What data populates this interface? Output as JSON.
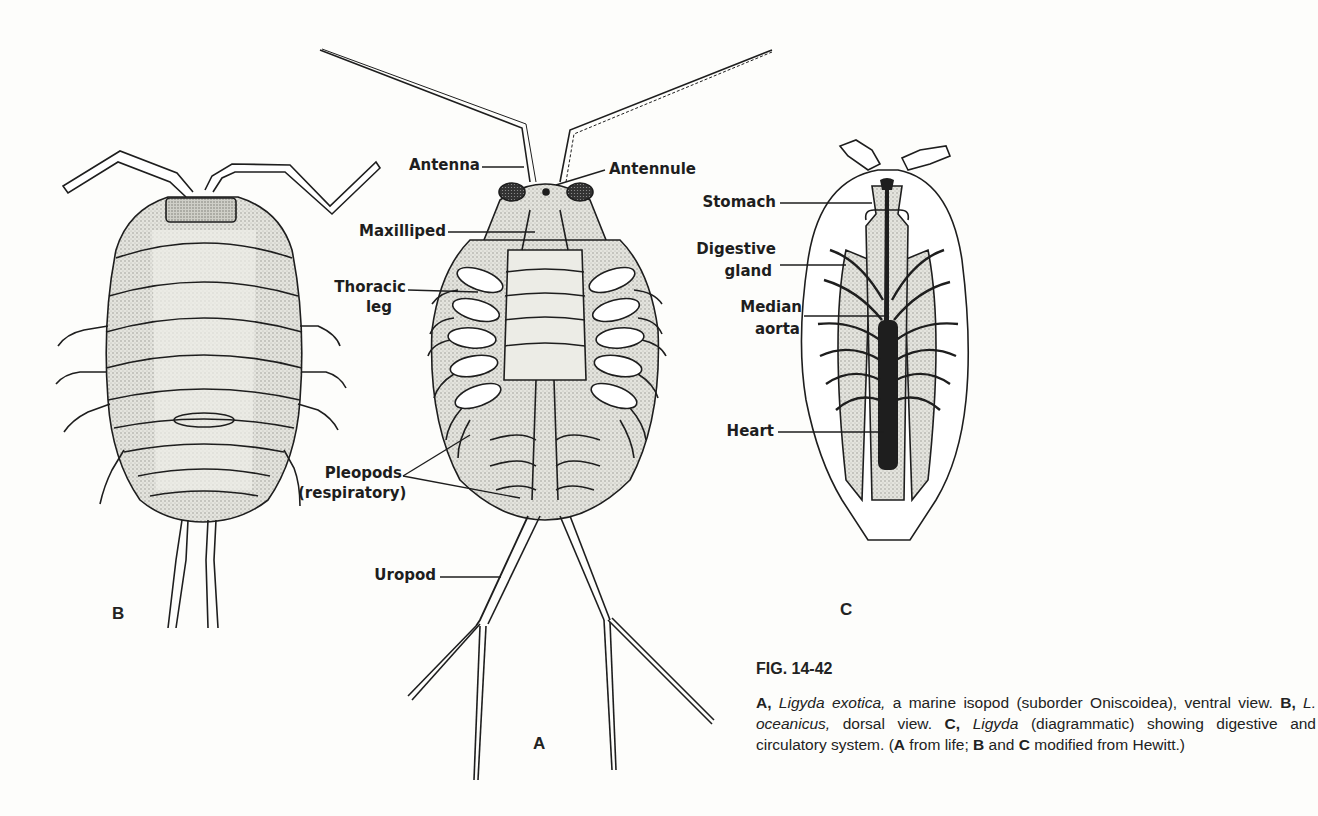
{
  "figure": {
    "number": "FIG. 14-42",
    "panels": {
      "A": {
        "letter": "A",
        "view": "ventral view"
      },
      "B": {
        "letter": "B",
        "view": "dorsal view"
      },
      "C": {
        "letter": "C",
        "view": "diagrammatic"
      }
    },
    "labels_A": {
      "antenna": "Antenna",
      "antennule": "Antennule",
      "maxilliped": "Maxilliped",
      "thoracic_leg_1": "Thoracic",
      "thoracic_leg_2": "leg",
      "pleopods_1": "Pleopods",
      "pleopods_2": "(respiratory)",
      "uropod": "Uropod"
    },
    "labels_C": {
      "stomach": "Stomach",
      "digestive_gland_1": "Digestive",
      "digestive_gland_2": "gland",
      "median_aorta_1": "Median",
      "median_aorta_2": "aorta",
      "heart": "Heart"
    },
    "caption": {
      "a_letter": "A,",
      "a_species": "Ligyda exotica,",
      "a_desc": " a marine isopod (suborder Oniscoidea), ventral view. ",
      "b_letter": "B,",
      "b_species": "L. oceanicus,",
      "b_desc": " dorsal view. ",
      "c_letter": "C,",
      "c_species": "Ligyda",
      "c_desc": " (diagrammatic) showing digestive and circulatory system. (",
      "src_a": "A",
      "src_a_text": " from life; ",
      "src_b": "B",
      "src_and": " and ",
      "src_c": "C",
      "src_end": " modified from Hewitt.)"
    },
    "colors": {
      "ink": "#1e1e1e",
      "paper": "#fdfdfb",
      "stipple": "#b9b9b3",
      "stipple_light": "#dcdcd6"
    }
  }
}
